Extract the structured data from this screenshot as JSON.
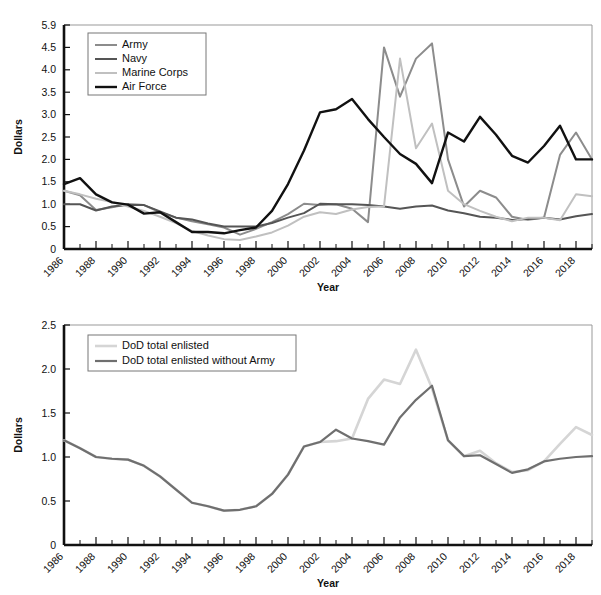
{
  "chart_data": [
    {
      "id": "top",
      "type": "line",
      "title": "",
      "xlabel": "Year",
      "ylabel": "Dollars",
      "grid": false,
      "legend_position": "top-left",
      "xlim": [
        1986,
        2019
      ],
      "ylim": [
        0,
        5.9
      ],
      "ytick_labels": [
        "0",
        "0.5",
        "1.0",
        "1.5",
        "2.0",
        "2.5",
        "3.0",
        "3.5",
        "4.0",
        "4.5",
        "5.9"
      ],
      "ytick_values": [
        0,
        0.5,
        1.0,
        1.5,
        2.0,
        2.5,
        3.0,
        3.5,
        4.0,
        4.5,
        5.9
      ],
      "xtick_labels": [
        "1986",
        "1988",
        "1990",
        "1992",
        "1994",
        "1996",
        "1998",
        "2000",
        "2002",
        "2004",
        "2006",
        "2008",
        "2010",
        "2012",
        "2014",
        "2016",
        "2018"
      ],
      "xtick_values": [
        1986,
        1988,
        1990,
        1992,
        1994,
        1996,
        1998,
        2000,
        2002,
        2004,
        2006,
        2008,
        2010,
        2012,
        2014,
        2016,
        2018
      ],
      "x": [
        1986,
        1987,
        1988,
        1989,
        1990,
        1991,
        1992,
        1993,
        1994,
        1995,
        1996,
        1997,
        1998,
        1999,
        2000,
        2001,
        2002,
        2003,
        2004,
        2005,
        2006,
        2007,
        2008,
        2009,
        2010,
        2011,
        2012,
        2013,
        2014,
        2015,
        2016,
        2017,
        2018,
        2019
      ],
      "series": [
        {
          "name": "Army",
          "color": "#8c8c8c",
          "width": 2.0,
          "values": [
            1.3,
            1.2,
            0.87,
            0.93,
            1.0,
            0.98,
            0.82,
            0.7,
            0.62,
            0.55,
            0.48,
            0.32,
            0.45,
            0.6,
            0.78,
            1.01,
            0.98,
            1.0,
            0.9,
            0.6,
            4.5,
            3.4,
            4.25,
            4.75,
            2.0,
            0.95,
            1.3,
            1.15,
            0.72,
            0.65,
            0.7,
            2.1,
            2.6,
            2.0
          ]
        },
        {
          "name": "Navy",
          "color": "#555555",
          "width": 2.0,
          "values": [
            1.0,
            1.0,
            0.86,
            0.95,
            0.99,
            0.98,
            0.84,
            0.7,
            0.66,
            0.57,
            0.5,
            0.5,
            0.5,
            0.58,
            0.7,
            0.8,
            1.01,
            1.0,
            1.0,
            0.98,
            0.95,
            0.9,
            0.95,
            0.97,
            0.86,
            0.8,
            0.72,
            0.7,
            0.65,
            0.67,
            0.7,
            0.66,
            0.73,
            0.78
          ]
        },
        {
          "name": "Marine Corps",
          "color": "#c0c0c0",
          "width": 2.0,
          "values": [
            1.3,
            1.22,
            1.12,
            1.05,
            0.95,
            0.85,
            0.72,
            0.58,
            0.4,
            0.3,
            0.22,
            0.2,
            0.28,
            0.37,
            0.52,
            0.72,
            0.82,
            0.78,
            0.88,
            0.94,
            0.95,
            4.25,
            2.25,
            2.8,
            1.3,
            1.0,
            0.85,
            0.72,
            0.62,
            0.7,
            0.7,
            0.64,
            1.22,
            1.18
          ]
        },
        {
          "name": "Air Force",
          "color": "#111111",
          "width": 2.4,
          "values": [
            1.45,
            1.58,
            1.22,
            1.04,
            0.99,
            0.79,
            0.82,
            0.6,
            0.38,
            0.38,
            0.35,
            0.42,
            0.48,
            0.85,
            1.45,
            2.2,
            3.05,
            3.12,
            3.35,
            2.9,
            2.5,
            2.12,
            1.9,
            1.47,
            2.6,
            2.4,
            2.95,
            2.55,
            2.08,
            1.93,
            2.3,
            2.75,
            2.0,
            2.0
          ]
        }
      ]
    },
    {
      "id": "bottom",
      "type": "line",
      "title": "",
      "xlabel": "Year",
      "ylabel": "Dollars",
      "grid": false,
      "legend_position": "top-left",
      "xlim": [
        1986,
        2019
      ],
      "ylim": [
        0,
        2.5
      ],
      "ytick_labels": [
        "0",
        "0.5",
        "1.0",
        "1.5",
        "2.0",
        "2.5"
      ],
      "ytick_values": [
        0,
        0.5,
        1.0,
        1.5,
        2.0,
        2.5
      ],
      "xtick_labels": [
        "1986",
        "1988",
        "1990",
        "1992",
        "1994",
        "1996",
        "1998",
        "2000",
        "2002",
        "2004",
        "2006",
        "2008",
        "2010",
        "2012",
        "2014",
        "2016",
        "2018"
      ],
      "xtick_values": [
        1986,
        1988,
        1990,
        1992,
        1994,
        1996,
        1998,
        2000,
        2002,
        2004,
        2006,
        2008,
        2010,
        2012,
        2014,
        2016,
        2018
      ],
      "x": [
        1986,
        1987,
        1988,
        1989,
        1990,
        1991,
        1992,
        1993,
        1994,
        1995,
        1996,
        1997,
        1998,
        1999,
        2000,
        2001,
        2002,
        2003,
        2004,
        2005,
        2006,
        2007,
        2008,
        2009,
        2010,
        2011,
        2012,
        2013,
        2014,
        2015,
        2016,
        2017,
        2018,
        2019
      ],
      "series": [
        {
          "name": "DoD total enlisted",
          "color": "#d5d5d5",
          "width": 2.6,
          "values": [
            1.19,
            1.1,
            1.0,
            0.98,
            0.97,
            0.9,
            0.78,
            0.63,
            0.48,
            0.44,
            0.39,
            0.4,
            0.44,
            0.58,
            0.8,
            1.12,
            1.17,
            1.18,
            1.21,
            1.66,
            1.88,
            1.83,
            2.22,
            1.78,
            1.19,
            1.01,
            1.07,
            0.93,
            0.83,
            0.85,
            0.95,
            1.15,
            1.34,
            1.25
          ]
        },
        {
          "name": "DoD total enlisted without Army",
          "color": "#6f6f6f",
          "width": 2.2,
          "values": [
            1.19,
            1.1,
            1.0,
            0.98,
            0.97,
            0.9,
            0.78,
            0.63,
            0.48,
            0.44,
            0.39,
            0.4,
            0.44,
            0.58,
            0.8,
            1.12,
            1.17,
            1.31,
            1.21,
            1.18,
            1.14,
            1.45,
            1.65,
            1.81,
            1.19,
            1.01,
            1.02,
            0.92,
            0.82,
            0.86,
            0.95,
            0.98,
            1.0,
            1.01
          ]
        }
      ]
    }
  ]
}
